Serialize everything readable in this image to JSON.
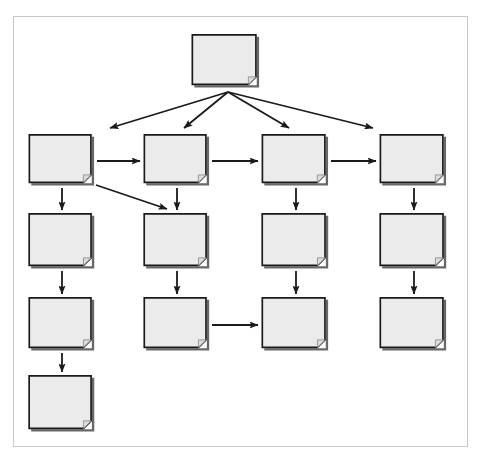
{
  "diagram": {
    "title": "",
    "type": "flowchart",
    "canvas": {
      "width": 482,
      "height": 463,
      "background": "#ffffff"
    },
    "frame": {
      "x": 13,
      "y": 16,
      "width": 455,
      "height": 431,
      "border_color": "#c9c9c9"
    },
    "style": {
      "node_fill": "#ebebeb",
      "node_stroke": "#1a1a1a",
      "node_shadow": "#4d4d4d",
      "edge_color": "#1a1a1a",
      "fold_size": 9,
      "node_shape": "document-folded-corner"
    },
    "nodes": [
      {
        "id": "n-r1c3",
        "label": "",
        "x": 191,
        "y": 34,
        "width": 70,
        "height": 55,
        "row": 1,
        "col": 3
      },
      {
        "id": "n-r2c1",
        "label": "",
        "x": 28,
        "y": 134,
        "width": 68,
        "height": 53,
        "row": 2,
        "col": 1
      },
      {
        "id": "n-r2c2",
        "label": "",
        "x": 143,
        "y": 134,
        "width": 68,
        "height": 53,
        "row": 2,
        "col": 2
      },
      {
        "id": "n-r2c3",
        "label": "",
        "x": 261,
        "y": 134,
        "width": 69,
        "height": 53,
        "row": 2,
        "col": 3
      },
      {
        "id": "n-r2c4",
        "label": "",
        "x": 379,
        "y": 134,
        "width": 69,
        "height": 53,
        "row": 2,
        "col": 4
      },
      {
        "id": "n-r3c1",
        "label": "",
        "x": 28,
        "y": 213,
        "width": 68,
        "height": 57,
        "row": 3,
        "col": 1
      },
      {
        "id": "n-r3c2",
        "label": "",
        "x": 143,
        "y": 213,
        "width": 68,
        "height": 57,
        "row": 3,
        "col": 2
      },
      {
        "id": "n-r3c3",
        "label": "",
        "x": 261,
        "y": 213,
        "width": 69,
        "height": 57,
        "row": 3,
        "col": 3
      },
      {
        "id": "n-r3c4",
        "label": "",
        "x": 379,
        "y": 213,
        "width": 69,
        "height": 57,
        "row": 3,
        "col": 4
      },
      {
        "id": "n-r4c1",
        "label": "",
        "x": 28,
        "y": 297,
        "width": 68,
        "height": 55,
        "row": 4,
        "col": 1
      },
      {
        "id": "n-r4c2",
        "label": "",
        "x": 143,
        "y": 297,
        "width": 68,
        "height": 55,
        "row": 4,
        "col": 2
      },
      {
        "id": "n-r4c3",
        "label": "",
        "x": 261,
        "y": 297,
        "width": 69,
        "height": 55,
        "row": 4,
        "col": 3
      },
      {
        "id": "n-r4c4",
        "label": "",
        "x": 379,
        "y": 297,
        "width": 69,
        "height": 55,
        "row": 4,
        "col": 4
      },
      {
        "id": "n-r5c1",
        "label": "",
        "x": 28,
        "y": 375,
        "width": 68,
        "height": 58,
        "row": 5,
        "col": 1
      }
    ],
    "edges": [
      {
        "id": "e-root-r2c1",
        "from": "n-r1c3",
        "to": "n-r2c1",
        "kind": "fan",
        "x1": 228,
        "y1": 92,
        "x2": 110,
        "y2": 128
      },
      {
        "id": "e-root-r2c2",
        "from": "n-r1c3",
        "to": "n-r2c2",
        "kind": "fan",
        "x1": 228,
        "y1": 92,
        "x2": 184,
        "y2": 128
      },
      {
        "id": "e-root-r2c3",
        "from": "n-r1c3",
        "to": "n-r2c3",
        "kind": "fan",
        "x1": 228,
        "y1": 92,
        "x2": 289,
        "y2": 128
      },
      {
        "id": "e-root-r2c4",
        "from": "n-r1c3",
        "to": "n-r2c4",
        "kind": "fan",
        "x1": 228,
        "y1": 92,
        "x2": 373,
        "y2": 128
      },
      {
        "id": "e-r2c1-r2c2",
        "from": "n-r2c1",
        "to": "n-r2c2",
        "kind": "horizontal",
        "x1": 97,
        "y1": 161,
        "x2": 140,
        "y2": 161
      },
      {
        "id": "e-r2c2-r2c3",
        "from": "n-r2c2",
        "to": "n-r2c3",
        "kind": "horizontal",
        "x1": 212,
        "y1": 161,
        "x2": 258,
        "y2": 161
      },
      {
        "id": "e-r2c3-r2c4",
        "from": "n-r2c3",
        "to": "n-r2c4",
        "kind": "horizontal",
        "x1": 331,
        "y1": 161,
        "x2": 376,
        "y2": 161
      },
      {
        "id": "e-r2c1-r3c1",
        "from": "n-r2c1",
        "to": "n-r3c1",
        "kind": "vertical",
        "x1": 62,
        "y1": 188,
        "x2": 62,
        "y2": 210
      },
      {
        "id": "e-r2c2-r3c2",
        "from": "n-r2c2",
        "to": "n-r3c2",
        "kind": "vertical",
        "x1": 177,
        "y1": 188,
        "x2": 177,
        "y2": 210
      },
      {
        "id": "e-r2c3-r3c3",
        "from": "n-r2c3",
        "to": "n-r3c3",
        "kind": "vertical",
        "x1": 296,
        "y1": 188,
        "x2": 296,
        "y2": 210
      },
      {
        "id": "e-r2c4-r3c4",
        "from": "n-r2c4",
        "to": "n-r3c4",
        "kind": "vertical",
        "x1": 414,
        "y1": 188,
        "x2": 414,
        "y2": 210
      },
      {
        "id": "e-r2c1-r3c2",
        "from": "n-r2c1",
        "to": "n-r3c2",
        "kind": "diagonal",
        "x1": 96,
        "y1": 185,
        "x2": 167,
        "y2": 209
      },
      {
        "id": "e-r3c1-r4c1",
        "from": "n-r3c1",
        "to": "n-r4c1",
        "kind": "vertical",
        "x1": 62,
        "y1": 271,
        "x2": 62,
        "y2": 294
      },
      {
        "id": "e-r3c2-r4c2",
        "from": "n-r3c2",
        "to": "n-r4c2",
        "kind": "vertical",
        "x1": 177,
        "y1": 271,
        "x2": 177,
        "y2": 294
      },
      {
        "id": "e-r3c3-r4c3",
        "from": "n-r3c3",
        "to": "n-r4c3",
        "kind": "vertical",
        "x1": 296,
        "y1": 271,
        "x2": 296,
        "y2": 294
      },
      {
        "id": "e-r3c4-r4c4",
        "from": "n-r3c4",
        "to": "n-r4c4",
        "kind": "vertical",
        "x1": 414,
        "y1": 271,
        "x2": 414,
        "y2": 294
      },
      {
        "id": "e-r4c2-r4c3",
        "from": "n-r4c2",
        "to": "n-r4c3",
        "kind": "horizontal",
        "x1": 212,
        "y1": 325,
        "x2": 258,
        "y2": 325
      },
      {
        "id": "e-r4c1-r5c1",
        "from": "n-r4c1",
        "to": "n-r5c1",
        "kind": "vertical",
        "x1": 62,
        "y1": 353,
        "x2": 62,
        "y2": 372
      }
    ]
  }
}
